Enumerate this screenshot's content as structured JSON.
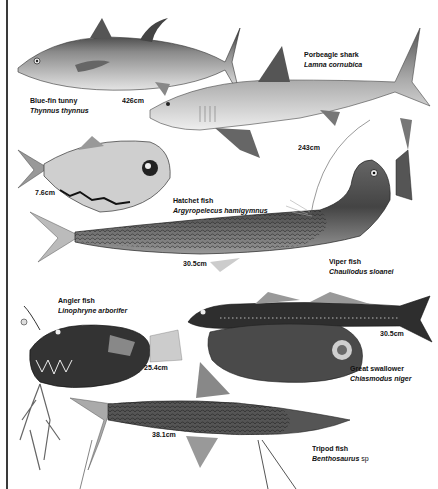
{
  "plate": {
    "left_border": true
  },
  "fish": [
    {
      "id": "bluefin-tunny",
      "common_name": "Blue-fin tunny",
      "latin_name": "Thynnus thynnus",
      "size": "426cm"
    },
    {
      "id": "porbeagle-shark",
      "common_name": "Porbeagle shark",
      "latin_name": "Lamna cornubica",
      "size": "243cm"
    },
    {
      "id": "hatchet-fish",
      "common_name": "Hatchet fish",
      "latin_name": "Argyropelecus hamigymnus",
      "size": "7.6cm"
    },
    {
      "id": "viper-fish",
      "common_name": "Viper fish",
      "latin_name": "Chauliodus sloanei",
      "size": "30.5cm"
    },
    {
      "id": "angler-fish",
      "common_name": "Angler fish",
      "latin_name": "Linophryne arborifer",
      "size": "25.4cm"
    },
    {
      "id": "great-swallower",
      "common_name": "Great swallower",
      "latin_name": "Chiasmodus niger",
      "size": "30.5cm"
    },
    {
      "id": "tripod-fish",
      "common_name": "Tripod fish",
      "latin_name": "Benthosaurus",
      "latin_suffix": "sp",
      "size": "38.1cm"
    }
  ]
}
